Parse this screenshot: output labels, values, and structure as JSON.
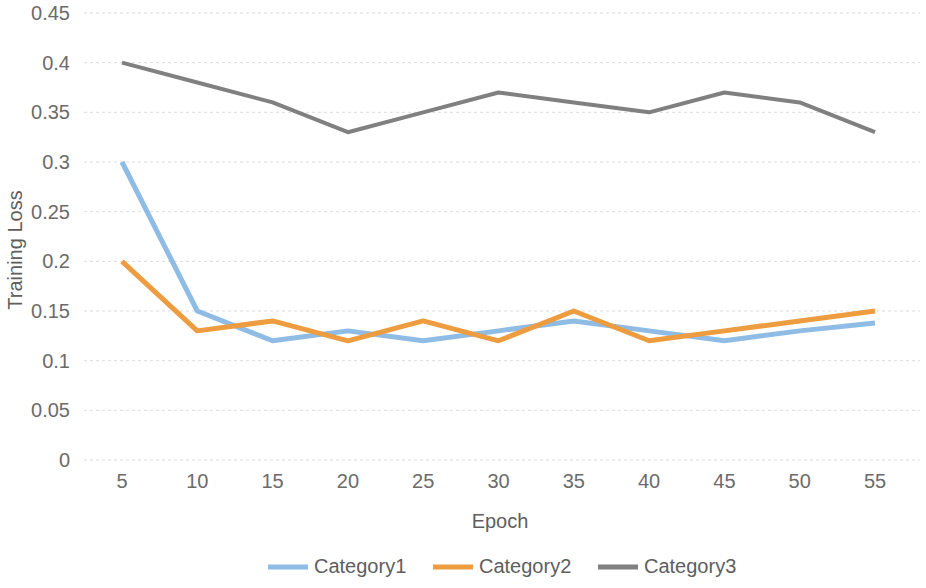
{
  "chart_data": {
    "type": "line",
    "title": "",
    "xlabel": "Epoch",
    "ylabel": "Training Loss",
    "x": [
      5,
      10,
      15,
      20,
      25,
      30,
      35,
      40,
      45,
      50,
      55
    ],
    "categories": [
      "5",
      "10",
      "15",
      "20",
      "25",
      "30",
      "35",
      "40",
      "45",
      "50",
      "55"
    ],
    "xtick_labels": [
      "5",
      "10",
      "15",
      "20",
      "25",
      "30",
      "35",
      "40",
      "45",
      "50",
      "55"
    ],
    "ytick_labels": [
      "0",
      "0.05",
      "0.1",
      "0.15",
      "0.2",
      "0.25",
      "0.3",
      "0.35",
      "0.4",
      "0.45"
    ],
    "ytick_values": [
      0,
      0.05,
      0.1,
      0.15,
      0.2,
      0.25,
      0.3,
      0.35,
      0.4,
      0.45
    ],
    "ylim": [
      0,
      0.45
    ],
    "xlim": [
      5,
      55
    ],
    "grid": "horizontal",
    "legend_position": "bottom",
    "series": [
      {
        "name": "Category1",
        "color": "#8FBCE5",
        "values": [
          0.3,
          0.15,
          0.12,
          0.13,
          0.12,
          0.13,
          0.14,
          0.13,
          0.12,
          0.13,
          0.138
        ]
      },
      {
        "name": "Category2",
        "color": "#ED9C3F",
        "values": [
          0.2,
          0.13,
          0.14,
          0.12,
          0.14,
          0.12,
          0.15,
          0.12,
          0.13,
          0.14,
          0.15
        ]
      },
      {
        "name": "Category3",
        "color": "#808080",
        "values": [
          0.4,
          0.38,
          0.36,
          0.33,
          0.35,
          0.37,
          0.36,
          0.35,
          0.37,
          0.36,
          0.33
        ]
      }
    ]
  },
  "axis": {
    "y_title": "Training Loss",
    "x_title": "Epoch"
  },
  "legend": {
    "items": [
      {
        "label": "Category1",
        "color": "#8FBCE5"
      },
      {
        "label": "Category2",
        "color": "#ED9C3F"
      },
      {
        "label": "Category3",
        "color": "#808080"
      }
    ]
  }
}
